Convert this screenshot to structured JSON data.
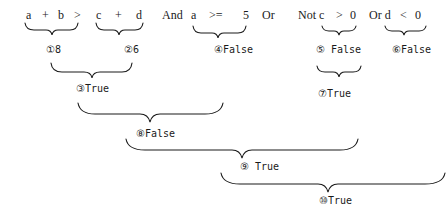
{
  "expression": {
    "tokens": [
      {
        "id": "a1",
        "text": "a"
      },
      {
        "id": "plus1",
        "text": "+"
      },
      {
        "id": "b",
        "text": "b"
      },
      {
        "id": "gt1",
        "text": ">"
      },
      {
        "id": "c1",
        "text": "c"
      },
      {
        "id": "plus2",
        "text": "+"
      },
      {
        "id": "d1",
        "text": "d"
      },
      {
        "id": "and",
        "text": "And"
      },
      {
        "id": "a2",
        "text": "a"
      },
      {
        "id": "gte",
        "text": ">="
      },
      {
        "id": "five",
        "text": "5"
      },
      {
        "id": "or1",
        "text": "Or"
      },
      {
        "id": "not_c",
        "text": "Not c"
      },
      {
        "id": "gt2",
        "text": ">"
      },
      {
        "id": "zero1",
        "text": "0"
      },
      {
        "id": "or_d",
        "text": "Or d"
      },
      {
        "id": "lt",
        "text": "<"
      },
      {
        "id": "zero2",
        "text": "0"
      }
    ]
  },
  "steps": [
    {
      "n": 1,
      "label": "①8",
      "covers": "a + b"
    },
    {
      "n": 2,
      "label": "②6",
      "covers": "c + d"
    },
    {
      "n": 3,
      "label": "③True",
      "covers": "①8 > ②6"
    },
    {
      "n": 4,
      "label": "④False",
      "covers": "a >= 5"
    },
    {
      "n": 5,
      "label": "⑤ False",
      "covers": "c > 0"
    },
    {
      "n": 6,
      "label": "⑥False",
      "covers": "d < 0"
    },
    {
      "n": 7,
      "label": "⑦True",
      "covers": "Not ⑤"
    },
    {
      "n": 8,
      "label": "⑧False",
      "covers": "③ And ④"
    },
    {
      "n": 9,
      "label": "⑨ True",
      "covers": "⑧ Or ⑦"
    },
    {
      "n": 10,
      "label": "⑩True",
      "covers": "⑨ Or ⑥"
    }
  ]
}
